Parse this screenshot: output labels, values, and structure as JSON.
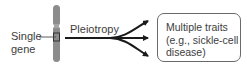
{
  "diagram": {
    "source_label_line1": "Single",
    "source_label_line2": "gene",
    "arrow_label": "Pleiotropy",
    "target_box": {
      "line1": "Multiple traits",
      "line2": "(e.g., sickle-cell",
      "line3": "disease)"
    },
    "colors": {
      "chromosome": "#8a8a8a",
      "arrow": "#1a1a1a",
      "text": "#3d3d3d"
    }
  }
}
